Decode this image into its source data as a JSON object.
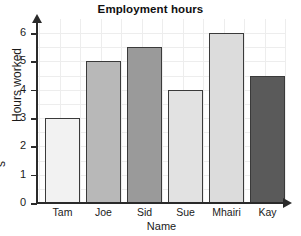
{
  "chart_data": {
    "type": "bar",
    "title": "Employment hours",
    "xlabel": "Name",
    "ylabel": "Hours worked",
    "categories": [
      "Tam",
      "Joe",
      "Sid",
      "Sue",
      "Mhairi",
      "Kay"
    ],
    "values": [
      3,
      5,
      5.5,
      4,
      6,
      4.5
    ],
    "bar_colors": [
      "#f2f2f2",
      "#b8b8b8",
      "#9a9a9a",
      "#e2e2e2",
      "#dcdcdc",
      "#5a5a5a"
    ],
    "bar_border_color": "#3a3a3a",
    "ylim": [
      0,
      6.4
    ],
    "y_ticks": [
      0,
      1,
      2,
      3,
      4,
      5,
      6
    ],
    "y_tick_labels": [
      "0",
      "1",
      "2",
      "3",
      "4",
      "5",
      "6"
    ],
    "grid": true,
    "grid_color": "#ededed",
    "legend": null,
    "axis_color": "#2a2a2a",
    "background": "#ffffff"
  },
  "edge_fragment": {
    "text": "s"
  }
}
